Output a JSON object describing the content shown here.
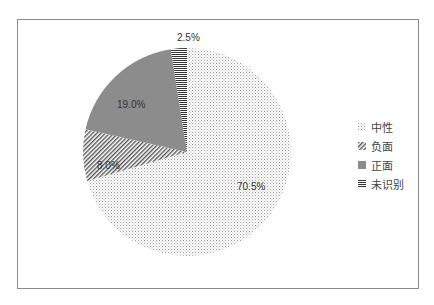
{
  "chart_data": {
    "type": "pie",
    "title": "",
    "categories": [
      "中性",
      "负面",
      "正面",
      "未识别"
    ],
    "values": [
      70.5,
      8.0,
      19.0,
      2.5
    ],
    "labels": [
      "70.5%",
      "8.0%",
      "19.0%",
      "2.5%"
    ],
    "legend_position": "right",
    "patterns": [
      "dotted",
      "diagonal-hatch",
      "solid-gray",
      "horizontal-lines"
    ],
    "colors": [
      "#bfbfbf",
      "#666666",
      "#8c8c8c",
      "#333333"
    ]
  },
  "legend": {
    "items": [
      {
        "label": "中性"
      },
      {
        "label": "负面"
      },
      {
        "label": "正面"
      },
      {
        "label": "未识别"
      }
    ]
  }
}
